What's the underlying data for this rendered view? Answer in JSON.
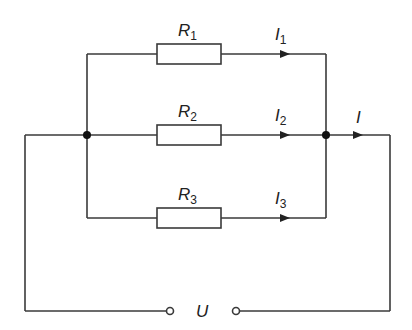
{
  "diagram": {
    "type": "parallel resistor circuit",
    "colors": {
      "line": "#3a3a3a",
      "background": "#ffffff"
    },
    "branches": [
      {
        "resistor": {
          "symbol": "R",
          "index": "1"
        },
        "current": {
          "symbol": "I",
          "index": "1"
        }
      },
      {
        "resistor": {
          "symbol": "R",
          "index": "2"
        },
        "current": {
          "symbol": "I",
          "index": "2"
        }
      },
      {
        "resistor": {
          "symbol": "R",
          "index": "3"
        },
        "current": {
          "symbol": "I",
          "index": "3"
        }
      }
    ],
    "total_current": {
      "symbol": "I"
    },
    "source": {
      "symbol": "U"
    }
  }
}
